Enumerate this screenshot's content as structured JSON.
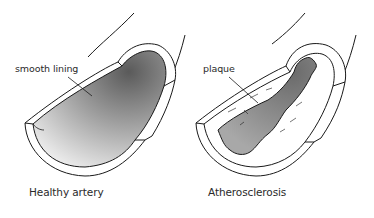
{
  "diagram": {
    "panels": [
      {
        "id": "healthy",
        "caption": "Healthy artery",
        "annotation": "smooth lining"
      },
      {
        "id": "diseased",
        "caption": "Atherosclerosis",
        "annotation": "plaque"
      }
    ],
    "colors": {
      "stroke": "#1a1a1a",
      "wall": "#ffffff",
      "lumen_dark": "#6e6e6e",
      "lumen_light": "#ececec",
      "plaque_lumen": "#8a8a8a"
    }
  }
}
